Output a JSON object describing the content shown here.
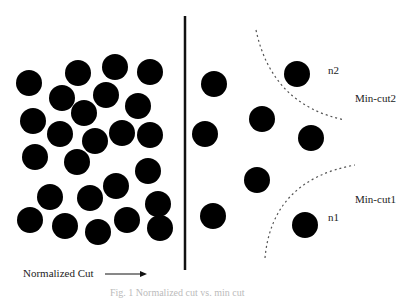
{
  "diagram": {
    "labels": {
      "n2": "n2",
      "min_cut2": "Min-cut2",
      "min_cut1": "Min-cut1",
      "n1": "n1",
      "normalized_cut": "Normalized Cut",
      "caption": "Fig. 1   Normalized cut vs. min cut"
    },
    "colors": {
      "node": "#000000",
      "line": "#111111",
      "dashed": "#555555",
      "text": "#222222"
    },
    "node_radius": 13,
    "left_nodes": [
      [
        29,
        83
      ],
      [
        78,
        73
      ],
      [
        115,
        67
      ],
      [
        150,
        72
      ],
      [
        62,
        98
      ],
      [
        106,
        95
      ],
      [
        138,
        106
      ],
      [
        84,
        113
      ],
      [
        33,
        121
      ],
      [
        60,
        134
      ],
      [
        95,
        141
      ],
      [
        122,
        133
      ],
      [
        150,
        135
      ],
      [
        35,
        157
      ],
      [
        77,
        162
      ],
      [
        148,
        171
      ],
      [
        116,
        186
      ],
      [
        50,
        197
      ],
      [
        90,
        198
      ],
      [
        158,
        204
      ],
      [
        30,
        220
      ],
      [
        65,
        226
      ],
      [
        98,
        232
      ],
      [
        127,
        220
      ],
      [
        160,
        228
      ]
    ],
    "right_nodes": [
      [
        214,
        84
      ],
      [
        297,
        74
      ],
      [
        262,
        119
      ],
      [
        205,
        134
      ],
      [
        311,
        138
      ],
      [
        257,
        180
      ],
      [
        213,
        216
      ],
      [
        305,
        225
      ]
    ],
    "normalized_cut_line": {
      "x": 185,
      "y1": 16,
      "y2": 270
    },
    "min_cut2_curve": "M256,30 Q272,105 345,120",
    "min_cut1_curve": "M265,258 Q272,180 355,165",
    "arrow": {
      "x1": 105,
      "x2": 147,
      "y": 274
    }
  }
}
